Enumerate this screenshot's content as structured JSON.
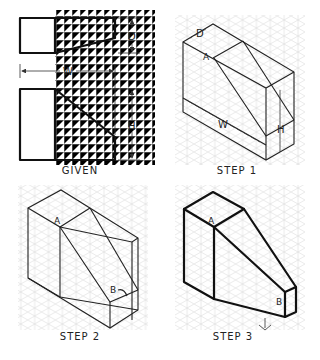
{
  "figure": {
    "panels": [
      {
        "id": "given",
        "caption": "GIVEN",
        "views": [
          "top-view",
          "front-view"
        ],
        "dimensions": {
          "depth": "D",
          "width": "W",
          "height": "H"
        }
      },
      {
        "id": "step1",
        "caption": "STEP 1",
        "point_labels": {
          "a": "A"
        },
        "dimensions": {
          "depth": "D",
          "width": "W",
          "height": "H"
        }
      },
      {
        "id": "step2",
        "caption": "STEP 2",
        "point_labels": {
          "a": "A",
          "b": "B"
        }
      },
      {
        "id": "step3",
        "caption": "STEP 3",
        "point_labels": {
          "a": "A",
          "b": "B"
        }
      }
    ]
  },
  "colors": {
    "line": "#111111",
    "grid": "#dcdcdc",
    "background": "#ffffff"
  }
}
